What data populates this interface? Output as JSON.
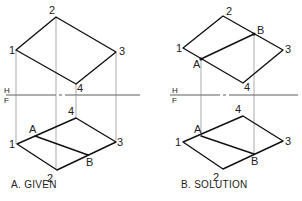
{
  "figure": {
    "fold_line": {
      "top_label": "H",
      "bottom_label": "F",
      "y": 95
    },
    "panels": [
      {
        "id": "given",
        "caption": "A. GIVEN",
        "top_view": {
          "points": {
            "1": [
              16,
              50
            ],
            "2": [
              56,
              17
            ],
            "3": [
              116,
              52
            ],
            "4": [
              76,
              84
            ]
          },
          "labels": {
            "1": "1",
            "2": "2",
            "3": "3",
            "4": "4"
          }
        },
        "front_view": {
          "points": {
            "1": [
              17,
              144
            ],
            "2": [
              57,
              170
            ],
            "3": [
              116,
              142
            ],
            "4": [
              76,
              118
            ],
            "A": [
              35,
              136
            ],
            "B": [
              88,
              155
            ]
          },
          "labels": {
            "1": "1",
            "2": "2",
            "3": "3",
            "4": "4",
            "A": "A",
            "B": "B"
          }
        }
      },
      {
        "id": "solution",
        "caption": "B. SOLUTION",
        "top_view": {
          "points": {
            "1": [
              183,
              48
            ],
            "2": [
              223,
              16
            ],
            "3": [
              283,
              50
            ],
            "4": [
              243,
              83
            ],
            "A": [
              201,
              59
            ],
            "B": [
              254,
              34
            ]
          },
          "labels": {
            "1": "1",
            "2": "2",
            "3": "3",
            "4": "4",
            "A": "A",
            "B": "B"
          }
        },
        "front_view": {
          "points": {
            "1": [
              183,
              142
            ],
            "2": [
              223,
              169
            ],
            "3": [
              283,
              141
            ],
            "4": [
              243,
              116
            ],
            "A": [
              201,
              136
            ],
            "B": [
              254,
              154
            ]
          },
          "labels": {
            "1": "1",
            "2": "2",
            "3": "3",
            "4": "4",
            "A": "A",
            "B": "B"
          }
        }
      }
    ]
  }
}
